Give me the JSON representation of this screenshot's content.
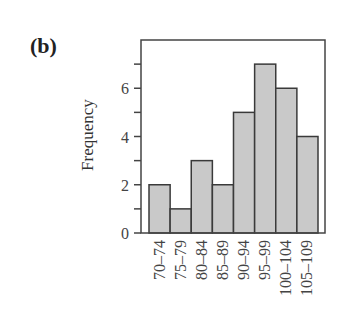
{
  "figure": {
    "panel_label": "(b)",
    "ylabel": "Frequency"
  },
  "colors": {
    "bar_fill": "#c9c9c9",
    "bar_stroke": "#3a3a3a",
    "axis": "#444444",
    "background": "#ffffff"
  },
  "chart_data": {
    "type": "bar",
    "title": "",
    "panel_label": "(b)",
    "xlabel": "",
    "ylabel": "Frequency",
    "categories": [
      "70–74",
      "75–79",
      "80–84",
      "85–89",
      "90–94",
      "95–99",
      "100–104",
      "105–109"
    ],
    "values": [
      2,
      1,
      3,
      2,
      5,
      7,
      6,
      4
    ],
    "ylim": [
      0,
      8
    ],
    "yticks_labeled": [
      0,
      2,
      4,
      6
    ],
    "yticks_minor": [
      1,
      3,
      5,
      7
    ],
    "grid": false,
    "legend": null,
    "histogram": true
  }
}
